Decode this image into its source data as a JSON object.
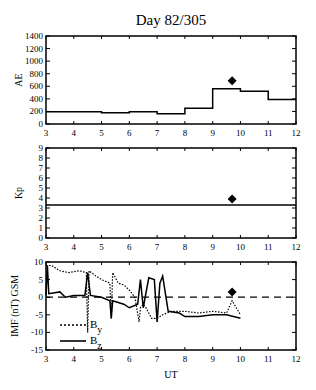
{
  "figure": {
    "title": "Day 82/305",
    "xlabel": "UT",
    "colors": {
      "line": "#000000",
      "background": "#ffffff"
    }
  },
  "chart_data": [
    {
      "type": "line",
      "step": true,
      "title": "Day 82/305",
      "xlabel": "",
      "ylabel": "AE",
      "xlim": [
        3,
        12
      ],
      "ylim": [
        0,
        1400
      ],
      "xticks": [
        3,
        4,
        5,
        6,
        7,
        8,
        9,
        10,
        11,
        12
      ],
      "yticks": [
        0,
        200,
        400,
        600,
        800,
        1000,
        1200,
        1400
      ],
      "series": [
        {
          "name": "AE hourly",
          "style": "solid-step",
          "x": [
            3,
            4,
            5,
            6,
            7,
            8,
            9,
            10,
            11,
            12
          ],
          "values": [
            195,
            195,
            180,
            195,
            165,
            250,
            560,
            520,
            390,
            390
          ]
        }
      ],
      "markers": [
        {
          "name": "event",
          "shape": "diamond",
          "x": 9.7,
          "y": 690
        }
      ]
    },
    {
      "type": "line",
      "ylabel": "Kp",
      "xlim": [
        3,
        12
      ],
      "ylim": [
        0,
        9
      ],
      "xticks": [
        3,
        4,
        5,
        6,
        7,
        8,
        9,
        10,
        11,
        12
      ],
      "yticks": [
        0,
        1,
        2,
        3,
        4,
        5,
        6,
        7,
        8,
        9
      ],
      "series": [
        {
          "name": "Kp",
          "style": "solid",
          "x": [
            3,
            12
          ],
          "values": [
            3.3,
            3.3
          ]
        }
      ],
      "markers": [
        {
          "name": "event",
          "shape": "diamond",
          "x": 9.7,
          "y": 3.9
        }
      ]
    },
    {
      "type": "line",
      "ylabel": "IMF (nT) GSM",
      "xlabel": "UT",
      "xlim": [
        3,
        12
      ],
      "ylim": [
        -15,
        10
      ],
      "xticks": [
        3,
        4,
        5,
        6,
        7,
        8,
        9,
        10,
        11,
        12
      ],
      "yticks": [
        -15,
        -10,
        -5,
        0,
        5,
        10
      ],
      "reference_line": {
        "y": 0,
        "style": "dashed"
      },
      "legend": [
        {
          "label": "B",
          "subscript": "y",
          "style": "dotted"
        },
        {
          "label": "B",
          "subscript": "z",
          "style": "solid"
        }
      ],
      "legend_position": "lower-left",
      "series": [
        {
          "name": "By",
          "style": "dotted",
          "x": [
            3.0,
            3.2,
            3.5,
            3.8,
            4.2,
            4.45,
            4.5,
            4.55,
            4.8,
            5.0,
            5.3,
            5.35,
            5.4,
            5.6,
            5.8,
            6.0,
            6.2,
            6.35,
            6.4,
            6.5,
            6.6,
            6.8,
            7.0,
            7.2,
            7.5,
            8.0,
            8.5,
            9.0,
            9.5,
            9.7,
            10.0
          ],
          "values": [
            9,
            9,
            7.5,
            7,
            7.5,
            7,
            -10,
            7.5,
            6,
            5,
            4,
            -6,
            7,
            4,
            3.5,
            2,
            0,
            -7,
            -3,
            -2,
            -3,
            -6,
            -6,
            -5,
            -4,
            -4,
            -4.5,
            -4,
            -4.5,
            -1,
            -5
          ]
        },
        {
          "name": "Bz",
          "style": "solid",
          "x": [
            3.0,
            3.05,
            3.1,
            3.5,
            3.7,
            4.0,
            4.4,
            4.5,
            4.6,
            5.0,
            5.3,
            5.35,
            5.4,
            5.6,
            5.8,
            6.0,
            6.3,
            6.4,
            6.5,
            6.7,
            6.9,
            7.0,
            7.1,
            7.2,
            7.4,
            7.8,
            8.0,
            8.5,
            9.0,
            9.5,
            10.0
          ],
          "values": [
            0.5,
            9,
            1,
            1.5,
            0,
            0.5,
            0.5,
            7,
            0.5,
            0,
            -1,
            -6,
            -1,
            -1.5,
            -2,
            -3,
            -2,
            5,
            -3,
            5.5,
            5,
            -7,
            4,
            6,
            -4,
            -4.5,
            -5.5,
            -5.5,
            -5,
            -5,
            -6
          ]
        }
      ],
      "markers": [
        {
          "name": "event",
          "shape": "diamond",
          "x": 9.7,
          "y": 1.5
        }
      ]
    }
  ]
}
